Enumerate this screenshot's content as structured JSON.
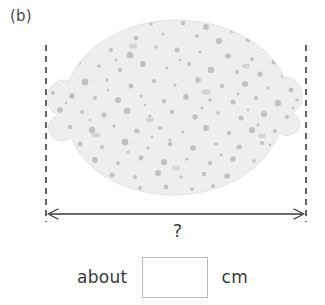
{
  "problem": {
    "part_label": "(b)",
    "unknown_marker": "?",
    "answer_prefix": "about",
    "answer_unit": "cm",
    "answer_value": ""
  },
  "figure": {
    "object_name": "lemon",
    "body_fill": "#efeeee",
    "speckle_fill": "#b8b8b8",
    "outline": "#e2e2e2",
    "guide_line_color": "#3d3d3d",
    "arrow_color": "#3d3d3d",
    "guide_left_x": 46,
    "guide_right_x": 306,
    "arrow_y": 214
  },
  "icons": {
    "left_guide": "dashed-guide-line-icon",
    "right_guide": "dashed-guide-line-icon",
    "span_arrow": "double-headed-arrow-icon",
    "fruit": "lemon-icon"
  }
}
